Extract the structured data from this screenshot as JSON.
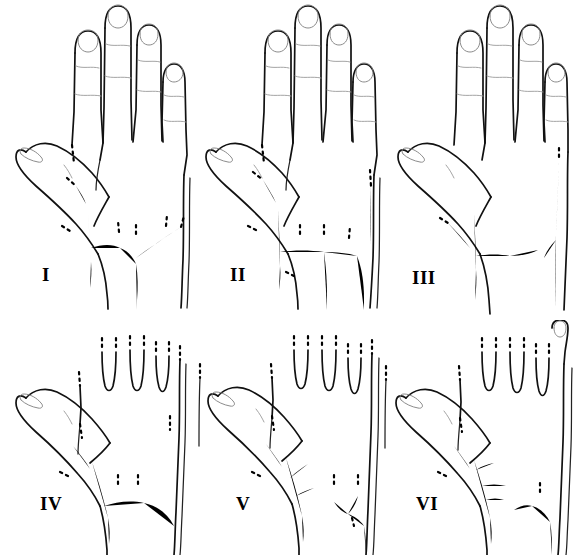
{
  "figure": {
    "background_color": "#ffffff",
    "ink_color": "#000000",
    "outline_color": "#111111",
    "crease_color": "#9a9a9a",
    "columns": 3,
    "rows": 2,
    "panel_count": 6
  },
  "panels": [
    {
      "id": "panel-1",
      "label": "I",
      "row": 1,
      "column": 1,
      "view": "dorsum of right hand, full hand shown",
      "description": "Dorsal venous arch with a thick cephalic trunk at the first web space; three tributary veins descend from the second, third and fourth interdigital spaces and converge into a single arch draining distally.",
      "thumb_visible": true,
      "fingers_shown": 4,
      "dominant_vein": "thick vertical trunk over first metacarpal",
      "branch_count": 4
    },
    {
      "id": "panel-2",
      "label": "II",
      "row": 1,
      "column": 2,
      "view": "dorsum of right hand, full hand shown",
      "description": "Thick first-web trunk with a low transverse arch; a prominent central tributary descends from the third interdigital space directly to the wrist, forming a V-shaped confluence.",
      "thumb_visible": true,
      "fingers_shown": 4,
      "dominant_vein": "thick vertical trunk over first metacarpal with straight transverse arch",
      "branch_count": 4
    },
    {
      "id": "panel-3",
      "label": "III",
      "row": 1,
      "column": 3,
      "view": "dorsum of right hand, full hand shown",
      "description": "Short thick first-web trunk; the arch is reduced to a thin transverse branch with small tributaries, and a separate slender basilic channel runs along the ulnar border.",
      "thumb_visible": true,
      "fingers_shown": 4,
      "dominant_vein": "short thick trunk with reduced thin arch",
      "branch_count": 3
    },
    {
      "id": "panel-4",
      "label": "IV",
      "row": 2,
      "column": 1,
      "view": "dorsum of right hand, fingers cropped",
      "description": "Oblique thick cephalic trunk crossing the first web; a broad curved arch sweeps across the dorsum with a central descending tributary and a separate ulnar vein.",
      "thumb_visible": true,
      "fingers_shown": 4,
      "dominant_vein": "oblique thick trunk with broad curved arch",
      "branch_count": 4
    },
    {
      "id": "panel-5",
      "label": "V",
      "row": 2,
      "column": 2,
      "view": "dorsum of right hand, fingers cropped",
      "description": "Oblique thick trunk with branching tributaries at the first web space; the ulnar portion carries an independent arch that joins a thick vein on the ulnar border of the wrist.",
      "thumb_visible": true,
      "fingers_shown": 4,
      "dominant_vein": "oblique thick trunk, separate ulnar arch",
      "branch_count": 5
    },
    {
      "id": "panel-6",
      "label": "VI",
      "row": 2,
      "column": 3,
      "view": "dorsum of right hand, fingers cropped",
      "description": "Thick branched first-web trunk with multiple short tributaries; a fully separate thin venous arch system lies over the central and ulnar dorsum with no connection to the cephalic trunk.",
      "thumb_visible": true,
      "fingers_shown": 4,
      "dominant_vein": "thick branched trunk, independent central arch",
      "branch_count": 6
    }
  ]
}
